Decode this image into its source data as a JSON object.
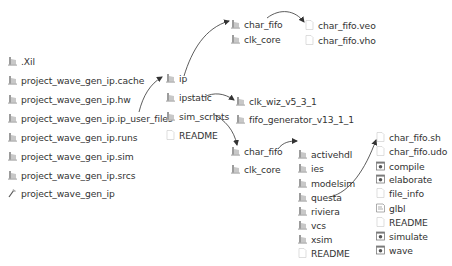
{
  "diagram": {
    "type": "file-tree",
    "colors": {
      "text": "#333333",
      "arrow": "#333333",
      "folder": "#b8b8b8",
      "file": "#e6e6e6"
    },
    "project_root": {
      "items": [
        {
          "label": ".Xil",
          "icon": "folder-icon"
        },
        {
          "label": "project_wave_gen_ip.cache",
          "icon": "folder-icon"
        },
        {
          "label": "project_wave_gen_ip.hw",
          "icon": "folder-icon"
        },
        {
          "label": "project_wave_gen_ip.ip_user_files",
          "icon": "folder-icon"
        },
        {
          "label": "project_wave_gen_ip.runs",
          "icon": "folder-icon"
        },
        {
          "label": "project_wave_gen_ip.sim",
          "icon": "folder-icon"
        },
        {
          "label": "project_wave_gen_ip.srcs",
          "icon": "folder-icon"
        },
        {
          "label": "project_wave_gen_ip",
          "icon": "project-file-icon"
        }
      ]
    },
    "ip_user_files": {
      "items": [
        {
          "label": "ip",
          "icon": "folder-icon"
        },
        {
          "label": "ipstatic",
          "icon": "folder-icon"
        },
        {
          "label": "sim_scripts",
          "icon": "folder-icon"
        },
        {
          "label": "README",
          "icon": "file-icon"
        }
      ]
    },
    "ip": {
      "items": [
        {
          "label": "char_fifo",
          "icon": "folder-icon"
        },
        {
          "label": "clk_core",
          "icon": "folder-icon"
        }
      ]
    },
    "ip_char_fifo": {
      "items": [
        {
          "label": "char_fifo.veo",
          "icon": "file-icon"
        },
        {
          "label": "char_fifo.vho",
          "icon": "file-icon"
        }
      ]
    },
    "ipstatic": {
      "items": [
        {
          "label": "clk_wiz_v5_3_1",
          "icon": "folder-icon"
        },
        {
          "label": "fifo_generator_v13_1_1",
          "icon": "folder-icon"
        }
      ]
    },
    "sim_scripts": {
      "items": [
        {
          "label": "char_fifo",
          "icon": "folder-icon"
        },
        {
          "label": "clk_core",
          "icon": "folder-icon"
        }
      ]
    },
    "sim_char_fifo": {
      "items": [
        {
          "label": "activehdl",
          "icon": "folder-icon"
        },
        {
          "label": "ies",
          "icon": "folder-icon"
        },
        {
          "label": "modelsim",
          "icon": "folder-icon"
        },
        {
          "label": "questa",
          "icon": "folder-icon"
        },
        {
          "label": "riviera",
          "icon": "folder-icon"
        },
        {
          "label": "vcs",
          "icon": "folder-icon"
        },
        {
          "label": "xsim",
          "icon": "folder-icon"
        },
        {
          "label": "README",
          "icon": "file-icon"
        }
      ]
    },
    "questa": {
      "items": [
        {
          "label": "char_fifo.sh",
          "icon": "file-icon"
        },
        {
          "label": "char_fifo.udo",
          "icon": "file-icon"
        },
        {
          "label": "compile",
          "icon": "script-icon"
        },
        {
          "label": "elaborate",
          "icon": "script-icon"
        },
        {
          "label": "file_info",
          "icon": "file-icon"
        },
        {
          "label": "glbl",
          "icon": "verilog-file-icon"
        },
        {
          "label": "README",
          "icon": "file-icon"
        },
        {
          "label": "simulate",
          "icon": "script-icon"
        },
        {
          "label": "wave",
          "icon": "script-icon"
        }
      ]
    },
    "arrows": [
      {
        "from": "project_wave_gen_ip.ip_user_files",
        "to": "ip_user_files"
      },
      {
        "from": "ip",
        "to": "ip.char_fifo"
      },
      {
        "from": "ip.char_fifo",
        "to": "ip_char_fifo"
      },
      {
        "from": "ipstatic",
        "to": "ipstatic.clk_wiz_v5_3_1"
      },
      {
        "from": "sim_scripts",
        "to": "sim_scripts.char_fifo"
      },
      {
        "from": "sim_scripts.char_fifo",
        "to": "sim_char_fifo"
      },
      {
        "from": "questa",
        "to": "questa_files"
      }
    ]
  }
}
